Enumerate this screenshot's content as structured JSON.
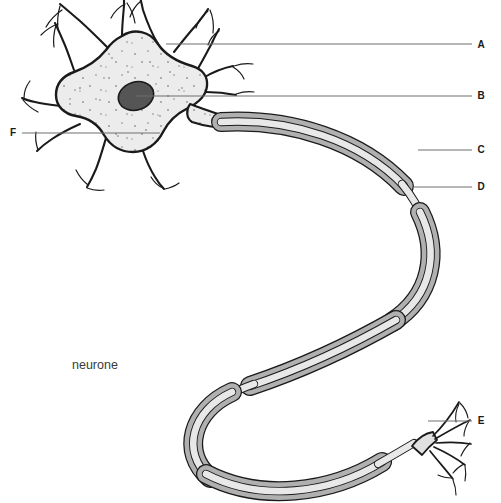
{
  "figure": {
    "caption": "neurone",
    "background_color": "#ffffff"
  },
  "colors": {
    "outline": "#1a1a1a",
    "cytoplasm": "#ececec",
    "nucleus": "#555555",
    "myelin": "#b0b0b0",
    "axon_core": "#e8e8e8",
    "leader_line": "#6e6e6e",
    "label": "#1a1a1a",
    "caption": "#3a3a3a"
  },
  "labels": [
    {
      "id": "A",
      "text": "A",
      "x": 481,
      "y": 48,
      "target": "dendrite",
      "leader": {
        "x1": 166,
        "y1": 44,
        "x2": 472,
        "y2": 44
      }
    },
    {
      "id": "B",
      "text": "B",
      "x": 481,
      "y": 99,
      "target": "nucleus",
      "leader": {
        "x1": 136,
        "y1": 96,
        "x2": 472,
        "y2": 96
      }
    },
    {
      "id": "C",
      "text": "C",
      "x": 481,
      "y": 153,
      "target": "myelin-sheath",
      "leader": {
        "x1": 418,
        "y1": 150,
        "x2": 472,
        "y2": 150
      }
    },
    {
      "id": "D",
      "text": "D",
      "x": 481,
      "y": 190,
      "target": "node-of-ranvier",
      "leader": {
        "x1": 412,
        "y1": 187,
        "x2": 472,
        "y2": 187
      }
    },
    {
      "id": "E",
      "text": "E",
      "x": 481,
      "y": 424,
      "target": "axon-terminals",
      "leader": {
        "x1": 428,
        "y1": 421,
        "x2": 472,
        "y2": 421
      }
    },
    {
      "id": "F",
      "text": "F",
      "x": 10,
      "y": 136,
      "target": "cell-body-cytoplasm",
      "leader": {
        "x1": 22,
        "y1": 133,
        "x2": 160,
        "y2": 133
      }
    }
  ],
  "caption_position": {
    "x": 72,
    "y": 369
  },
  "structures": {
    "cell_body": "soma",
    "dendrite_count": 6,
    "nucleus": "nucleus",
    "axon": "myelinated axon",
    "node_count": 4,
    "terminal_count": 5
  }
}
